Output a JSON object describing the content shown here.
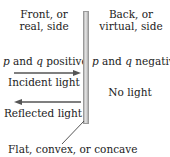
{
  "diagram": {
    "front_side": {
      "line1": "Front, or",
      "line2": "real, side",
      "sign_p": "p",
      "sign_mid": " and ",
      "sign_q": "q",
      "sign_end": " positive",
      "incident_label": "Incident light",
      "reflected_label": "Reflected light"
    },
    "back_side": {
      "line1": "Back, or",
      "line2": "virtual, side",
      "sign_p": "p",
      "sign_mid": " and ",
      "sign_q": "q",
      "sign_end": " negative",
      "no_light_label": "No light"
    },
    "mirror_caption": "Flat, convex, or concave",
    "colors": {
      "arrow": "#555555",
      "mirror": "#cfcfcf",
      "text": "#222222"
    }
  }
}
